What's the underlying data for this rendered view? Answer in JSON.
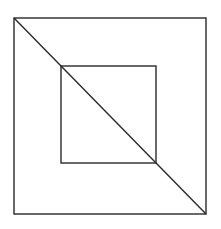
{
  "diagram": {
    "background": "#ffffff",
    "stroke_color": "#2a2a2a",
    "stroke_width": 1.4,
    "outer_square": {
      "x1": 14,
      "y1": 18,
      "x2": 206,
      "y2": 214
    },
    "inner_square": {
      "x1": 61,
      "y1": 66,
      "x2": 156,
      "y2": 163
    },
    "diagonal": {
      "x1": 14,
      "y1": 18,
      "x2": 206,
      "y2": 214
    }
  }
}
